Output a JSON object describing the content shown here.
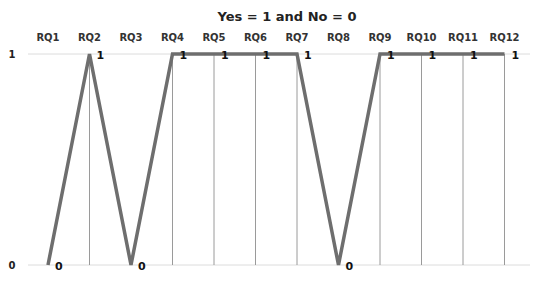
{
  "chart_data": {
    "type": "line",
    "title": "Yes = 1 and No = 0",
    "xlabel": "",
    "ylabel": "",
    "categories": [
      "RQ1",
      "RQ2",
      "RQ3",
      "RQ4",
      "RQ5",
      "RQ6",
      "RQ7",
      "RQ8",
      "RQ9",
      "RQ10",
      "RQ11",
      "RQ12"
    ],
    "series": [
      {
        "name": "Answer",
        "values": [
          0,
          1,
          0,
          1,
          1,
          1,
          1,
          0,
          1,
          1,
          1,
          1
        ],
        "color": "#6e6e6e"
      }
    ],
    "ylim": [
      0,
      1
    ],
    "yticks": [
      "0",
      "1"
    ],
    "xaxis_position": "top",
    "data_labels": true,
    "grid": {
      "horizontal": true,
      "drop_lines": true
    },
    "legend": "none"
  }
}
